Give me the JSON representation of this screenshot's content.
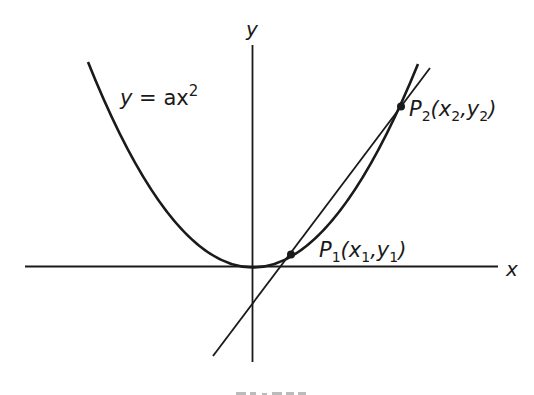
{
  "figure": {
    "curve_label": {
      "y": "y",
      "eq": " = ax",
      "exp": "2"
    },
    "axis_labels": {
      "x": "x",
      "y": "y"
    },
    "points": [
      {
        "name": "P",
        "sub": "1",
        "coords_open": "(x",
        "coords_sub1": "1",
        "coords_mid": ",y",
        "coords_sub2": "1",
        "coords_close": ")"
      },
      {
        "name": "P",
        "sub": "2",
        "coords_open": "(x",
        "coords_sub1": "2",
        "coords_mid": ",y",
        "coords_sub2": "2",
        "coords_close": ")"
      }
    ],
    "colors": {
      "ink": "#1a1a1a",
      "background": "#ffffff"
    }
  }
}
